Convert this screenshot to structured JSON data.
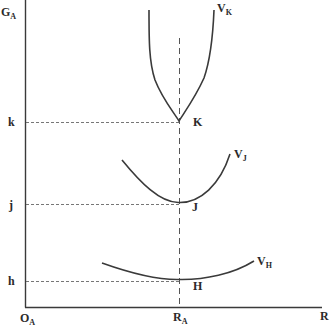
{
  "diagram": {
    "y_axis": {
      "label": "G",
      "subscript": "A"
    },
    "x_axis": {
      "label": "R"
    },
    "origin": {
      "label": "O",
      "subscript": "A"
    },
    "x_marker": {
      "label": "R",
      "subscript": "A"
    },
    "levels": [
      {
        "axis_label": "k",
        "point_label": "K",
        "curve_label": "V",
        "curve_subscript": "K"
      },
      {
        "axis_label": "j",
        "point_label": "J",
        "curve_label": "V",
        "curve_subscript": "J"
      },
      {
        "axis_label": "h",
        "point_label": "H",
        "curve_label": "V",
        "curve_subscript": "H"
      }
    ],
    "colors": {
      "line": "#3a3a3a",
      "dash": "#555555",
      "text": "#2a2a2a",
      "background": "#ffffff"
    }
  }
}
